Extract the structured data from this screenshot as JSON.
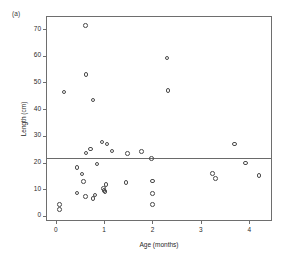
{
  "chart_data": {
    "type": "scatter",
    "title": "",
    "panel_label": "(a)",
    "xlabel": "Age (months)",
    "ylabel": "Length (cm)",
    "xlim": [
      -0.18,
      4.45
    ],
    "ylim": [
      -1.5,
      74.5
    ],
    "xticks": [
      0,
      1,
      2,
      3,
      4
    ],
    "xtick_labels": [
      "0",
      "1",
      "2",
      "3",
      "4"
    ],
    "yticks": [
      0,
      10,
      20,
      30,
      40,
      50,
      60,
      70
    ],
    "ytick_labels": [
      "0",
      "10",
      "20",
      "30",
      "40",
      "50",
      "60",
      "70"
    ],
    "grid": false,
    "legend": "none",
    "marker": "open-circle",
    "marker_color": "#4a4a4a",
    "frame_color": "#6e6e6e",
    "reference_line": {
      "orientation": "horizontal",
      "y": 21.7,
      "color": "#6a6a6a"
    },
    "points": [
      {
        "x": 0.08,
        "y": 4.2
      },
      {
        "x": 0.08,
        "y": 2.4
      },
      {
        "x": 0.17,
        "y": 46.4
      },
      {
        "x": 0.44,
        "y": 18.1
      },
      {
        "x": 0.44,
        "y": 8.6
      },
      {
        "x": 0.54,
        "y": 15.7
      },
      {
        "x": 0.58,
        "y": 13.0
      },
      {
        "x": 0.62,
        "y": 71.4
      },
      {
        "x": 0.63,
        "y": 23.6
      },
      {
        "x": 0.63,
        "y": 53.0
      },
      {
        "x": 0.62,
        "y": 7.4
      },
      {
        "x": 0.72,
        "y": 25.1
      },
      {
        "x": 0.77,
        "y": 43.5
      },
      {
        "x": 0.77,
        "y": 6.6
      },
      {
        "x": 0.81,
        "y": 7.9
      },
      {
        "x": 0.85,
        "y": 19.4
      },
      {
        "x": 0.96,
        "y": 27.7
      },
      {
        "x": 0.99,
        "y": 10.2
      },
      {
        "x": 1.0,
        "y": 9.6
      },
      {
        "x": 1.02,
        "y": 9.2
      },
      {
        "x": 1.04,
        "y": 11.9
      },
      {
        "x": 1.06,
        "y": 26.9
      },
      {
        "x": 1.16,
        "y": 24.3
      },
      {
        "x": 1.45,
        "y": 12.6
      },
      {
        "x": 1.48,
        "y": 23.3
      },
      {
        "x": 1.77,
        "y": 24.1
      },
      {
        "x": 1.98,
        "y": 21.6
      },
      {
        "x": 2.0,
        "y": 13.1
      },
      {
        "x": 2.0,
        "y": 8.4
      },
      {
        "x": 2.0,
        "y": 4.2
      },
      {
        "x": 2.3,
        "y": 59.1
      },
      {
        "x": 2.32,
        "y": 46.9
      },
      {
        "x": 3.24,
        "y": 16.0
      },
      {
        "x": 3.3,
        "y": 14.1
      },
      {
        "x": 3.69,
        "y": 26.9
      },
      {
        "x": 3.92,
        "y": 19.8
      },
      {
        "x": 4.2,
        "y": 15.1
      }
    ]
  }
}
